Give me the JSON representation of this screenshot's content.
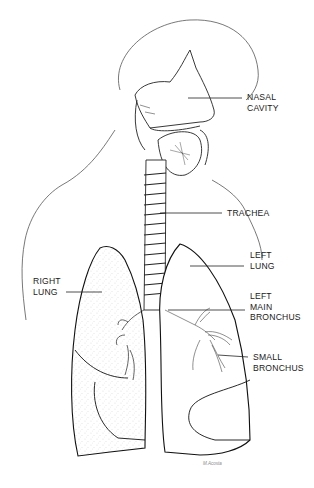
{
  "diagram": {
    "labels": [
      {
        "id": "nasal-cavity",
        "line1": "NASAL",
        "line2": "CAVITY",
        "x": 247,
        "y": 94
      },
      {
        "id": "trachea",
        "line1": "TRACHEA",
        "line2": "",
        "x": 227,
        "y": 209
      },
      {
        "id": "left-lung",
        "line1": "LEFT",
        "line2": "LUNG",
        "x": 250,
        "y": 251
      },
      {
        "id": "right-lung",
        "line1": "RIGHT",
        "line2": "LUNG",
        "x": 33,
        "y": 277
      },
      {
        "id": "left-main-bronchus",
        "line1": "LEFT",
        "line2": "MAIN",
        "line3": "BRONCHUS",
        "x": 250,
        "y": 292
      },
      {
        "id": "small-bronchus",
        "line1": "SMALL",
        "line2": "BRONCHUS",
        "x": 253,
        "y": 353
      }
    ],
    "signature": "M.Acosta"
  }
}
